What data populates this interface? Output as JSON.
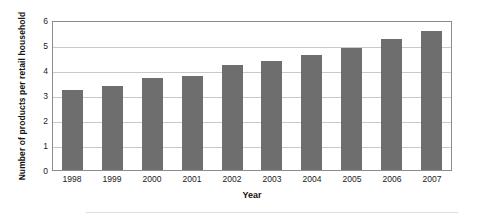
{
  "chart_data": {
    "type": "bar",
    "title": "",
    "subtitle": "",
    "xlabel": "Year",
    "ylabel": "Number of products per retail household",
    "categories": [
      "1998",
      "1999",
      "2000",
      "2001",
      "2002",
      "2003",
      "2004",
      "2005",
      "2006",
      "2007"
    ],
    "values": [
      3.2,
      3.35,
      3.7,
      3.78,
      4.2,
      4.35,
      4.6,
      4.9,
      5.25,
      5.55
    ],
    "series": [
      {
        "name": "Number of products per retail household",
        "values": [
          3.2,
          3.35,
          3.7,
          3.78,
          4.2,
          4.35,
          4.6,
          4.9,
          5.25,
          5.55
        ]
      }
    ],
    "ylim": [
      0,
      6
    ],
    "yticks": [
      0,
      1,
      2,
      3,
      4,
      5,
      6
    ],
    "ytick_labels": [
      "0",
      "1",
      "2",
      "3",
      "4",
      "5",
      "6"
    ],
    "grid": true,
    "grid_axis": "y",
    "legend": false,
    "legend_position": "none",
    "bar_color": "#6e6e6e",
    "grid_color": "#c9c9c9",
    "frame_color": "#8d8d8d",
    "background": "#ffffff"
  }
}
